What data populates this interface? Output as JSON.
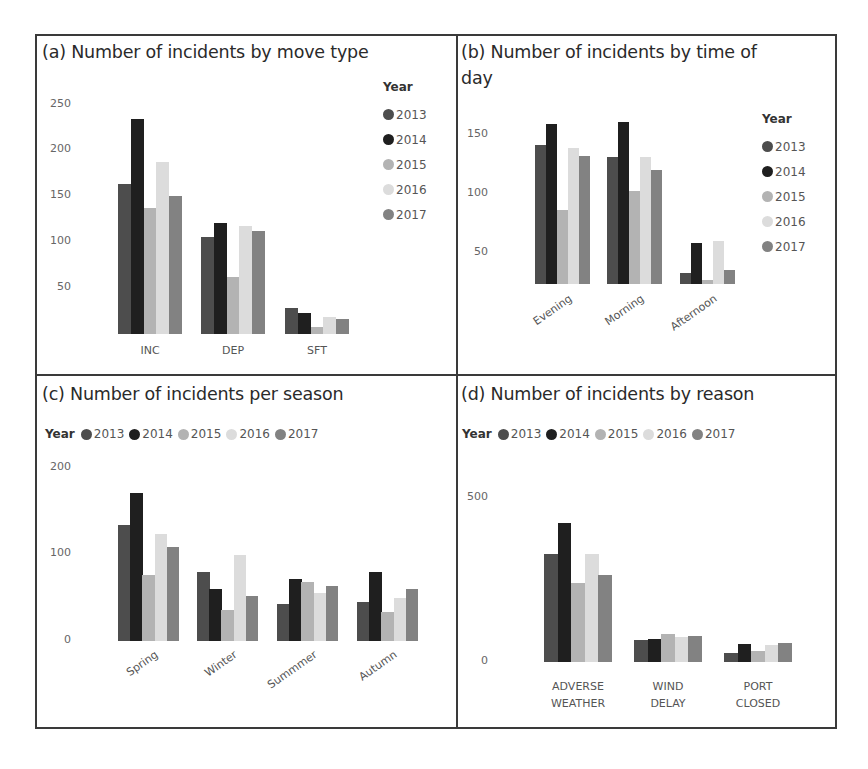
{
  "legend": {
    "title": "Year",
    "years": [
      "2013",
      "2014",
      "2015",
      "2016",
      "2017"
    ],
    "colors": [
      "#4d4d4d",
      "#1f1f1f",
      "#b3b3b3",
      "#dcdcdc",
      "#828282"
    ]
  },
  "chart_data": [
    {
      "id": "a",
      "type": "bar",
      "title": "(a) Number of incidents by move type",
      "xlabel": "",
      "ylabel": "",
      "categories": [
        "INC",
        "DEP",
        "SFT"
      ],
      "yticks": [
        50,
        100,
        150,
        200,
        250
      ],
      "ylim": [
        0,
        250
      ],
      "legend_position": "right",
      "grid": false,
      "series": [
        {
          "name": "2013",
          "values": [
            163,
            106,
            28
          ]
        },
        {
          "name": "2014",
          "values": [
            234,
            121,
            23
          ]
        },
        {
          "name": "2015",
          "values": [
            137,
            62,
            8
          ]
        },
        {
          "name": "2016",
          "values": [
            187,
            118,
            18
          ]
        },
        {
          "name": "2017",
          "values": [
            150,
            112,
            16
          ]
        }
      ]
    },
    {
      "id": "b",
      "type": "bar",
      "title": "(b) Number of incidents by time of day",
      "title_lines": [
        "(b) Number of incidents by time of",
        "day"
      ],
      "xlabel": "",
      "ylabel": "",
      "categories": [
        "Evening",
        "Morning",
        "Afternoon"
      ],
      "yticks": [
        50,
        100,
        150
      ],
      "ylim": [
        20,
        165
      ],
      "legend_position": "right",
      "grid": false,
      "series": [
        {
          "name": "2013",
          "values": [
            141,
            131,
            33
          ]
        },
        {
          "name": "2014",
          "values": [
            159,
            161,
            58
          ]
        },
        {
          "name": "2015",
          "values": [
            86,
            102,
            27
          ]
        },
        {
          "name": "2016",
          "values": [
            139,
            131,
            60
          ]
        },
        {
          "name": "2017",
          "values": [
            132,
            120,
            35
          ]
        }
      ]
    },
    {
      "id": "c",
      "type": "bar",
      "title": "(c) Number of incidents per season",
      "xlabel": "",
      "ylabel": "",
      "categories": [
        "Spring",
        "Winter",
        "Summmer",
        "Autumn"
      ],
      "yticks": [
        0,
        100,
        200
      ],
      "ylim": [
        0,
        200
      ],
      "legend_position": "top",
      "grid": false,
      "series": [
        {
          "name": "2013",
          "values": [
            134,
            80,
            43,
            45
          ]
        },
        {
          "name": "2014",
          "values": [
            171,
            60,
            71,
            80
          ]
        },
        {
          "name": "2015",
          "values": [
            76,
            36,
            68,
            33
          ]
        },
        {
          "name": "2016",
          "values": [
            123,
            99,
            55,
            50
          ]
        },
        {
          "name": "2017",
          "values": [
            108,
            52,
            64,
            60
          ]
        }
      ]
    },
    {
      "id": "d",
      "type": "bar",
      "title": "(d) Number of incidents by reason",
      "xlabel": "",
      "ylabel": "",
      "categories": [
        "ADVERSE WEATHER",
        "WIND DELAY",
        "PORT CLOSED"
      ],
      "category_lines": [
        [
          "ADVERSE",
          "WEATHER"
        ],
        [
          "WIND",
          "DELAY"
        ],
        [
          "PORT",
          "CLOSED"
        ]
      ],
      "yticks": [
        0,
        500
      ],
      "ylim": [
        0,
        500
      ],
      "legend_position": "top",
      "grid": false,
      "series": [
        {
          "name": "2013",
          "values": [
            328,
            66,
            26
          ]
        },
        {
          "name": "2014",
          "values": [
            421,
            69,
            56
          ]
        },
        {
          "name": "2015",
          "values": [
            241,
            84,
            33
          ]
        },
        {
          "name": "2016",
          "values": [
            328,
            76,
            51
          ]
        },
        {
          "name": "2017",
          "values": [
            265,
            79,
            57
          ]
        }
      ]
    }
  ]
}
